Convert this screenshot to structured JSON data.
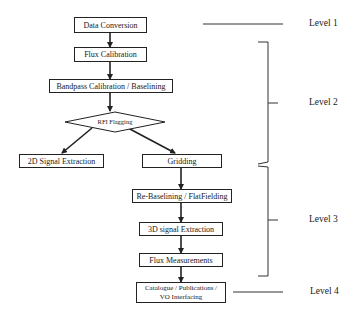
{
  "diagram": {
    "nodes": {
      "data_conversion": "Data Conversion",
      "flux_calibration": "Flux Calibration",
      "bandpass": "Bandpass Calibration / Baselining",
      "rfi_flagging": "RFI Flagging",
      "signal_2d": "2D Signal Extraction",
      "gridding": "Gridding",
      "rebaselining": "Re-Baselining / FlatFielding",
      "signal_3d": "3D signal Extraction",
      "flux_measurements": "Flux Measurements",
      "catalogue_line1": "Catalogue / Publications /",
      "catalogue_line2": "VO Interfacing"
    },
    "levels": {
      "level1": "Level 1",
      "level2": "Level 2",
      "level3": "Level 3",
      "level4": "Level 4"
    },
    "edges": [
      [
        "Data Conversion",
        "Flux Calibration"
      ],
      [
        "Flux Calibration",
        "Bandpass Calibration / Baselining"
      ],
      [
        "Bandpass Calibration / Baselining",
        "RFI Flagging"
      ],
      [
        "RFI Flagging",
        "2D Signal Extraction"
      ],
      [
        "RFI Flagging",
        "Gridding"
      ],
      [
        "Gridding",
        "Re-Baselining / FlatFielding"
      ],
      [
        "Re-Baselining / FlatFielding",
        "3D signal Extraction"
      ],
      [
        "3D signal Extraction",
        "Flux Measurements"
      ],
      [
        "Flux Measurements",
        "Catalogue / Publications / VO Interfacing"
      ]
    ],
    "colors": {
      "line": "#222222",
      "background": "#ffffff"
    }
  }
}
